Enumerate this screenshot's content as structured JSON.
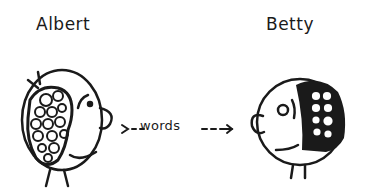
{
  "diagram": {
    "left_person": {
      "name": "Albert"
    },
    "right_person": {
      "name": "Betty"
    },
    "arrow": {
      "label": "words",
      "prefix": ">- -",
      "suffix": "- - -→",
      "direction": "left-to-right"
    }
  },
  "colors": {
    "ink": "#1a1a1a",
    "background": "#ffffff"
  }
}
